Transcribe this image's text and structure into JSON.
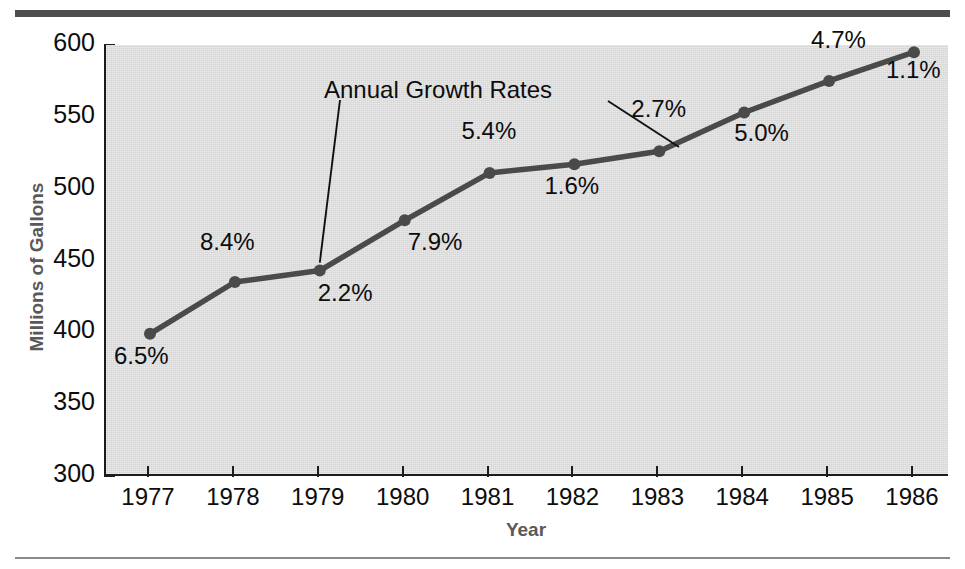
{
  "chart_data": {
    "type": "line",
    "title": "",
    "subtitle": "",
    "xlabel": "Year",
    "ylabel": "Millions of Gallons",
    "categories": [
      "1977",
      "1978",
      "1979",
      "1980",
      "1981",
      "1982",
      "1983",
      "1984",
      "1985",
      "1986"
    ],
    "x": [
      1977,
      1978,
      1979,
      1980,
      1981,
      1982,
      1983,
      1984,
      1985,
      1986
    ],
    "values": [
      399,
      435,
      443,
      478,
      511,
      517,
      526,
      553,
      575,
      595
    ],
    "ylim": [
      300,
      600
    ],
    "yticks": [
      300,
      350,
      400,
      450,
      500,
      550,
      600
    ],
    "ytick_labels": [
      "300",
      "350",
      "400",
      "450",
      "500",
      "550",
      "600"
    ],
    "xlim": [
      1977,
      1986
    ],
    "grid": false,
    "legend": "none",
    "series": [
      {
        "name": "Millions of Gallons",
        "values": [
          399,
          435,
          443,
          478,
          511,
          517,
          526,
          553,
          575,
          595
        ],
        "color": "#4a4a4a",
        "marker": "circle"
      }
    ],
    "data_labels": {
      "label": "Annual Growth Rates",
      "values": [
        "6.5%",
        "8.4%",
        "2.2%",
        "7.9%",
        "5.4%",
        "1.6%",
        "2.7%",
        "5.0%",
        "4.7%",
        "1.1%"
      ],
      "numeric": [
        6.5,
        8.4,
        2.2,
        7.9,
        5.4,
        1.6,
        2.7,
        5.0,
        4.7,
        1.1
      ]
    },
    "annotations": [
      {
        "text": "Annual Growth Rates",
        "leader_targets": [
          "1979 data point",
          "2.7% label"
        ]
      }
    ],
    "colors": {
      "line": "#4a4a4a",
      "marker": "#4a4a4a",
      "plot_background": "#d5d5d5",
      "axis": "#1c1c1c",
      "axis_title": "#595959",
      "tick_text": "#0d0d0d",
      "top_rule": "#4d4d4d",
      "bottom_rule": "#8a8a8a"
    }
  },
  "axis": {
    "ylabel": "Millions of Gallons",
    "xlabel": "Year"
  },
  "callout": {
    "text": "Annual Growth Rates"
  }
}
